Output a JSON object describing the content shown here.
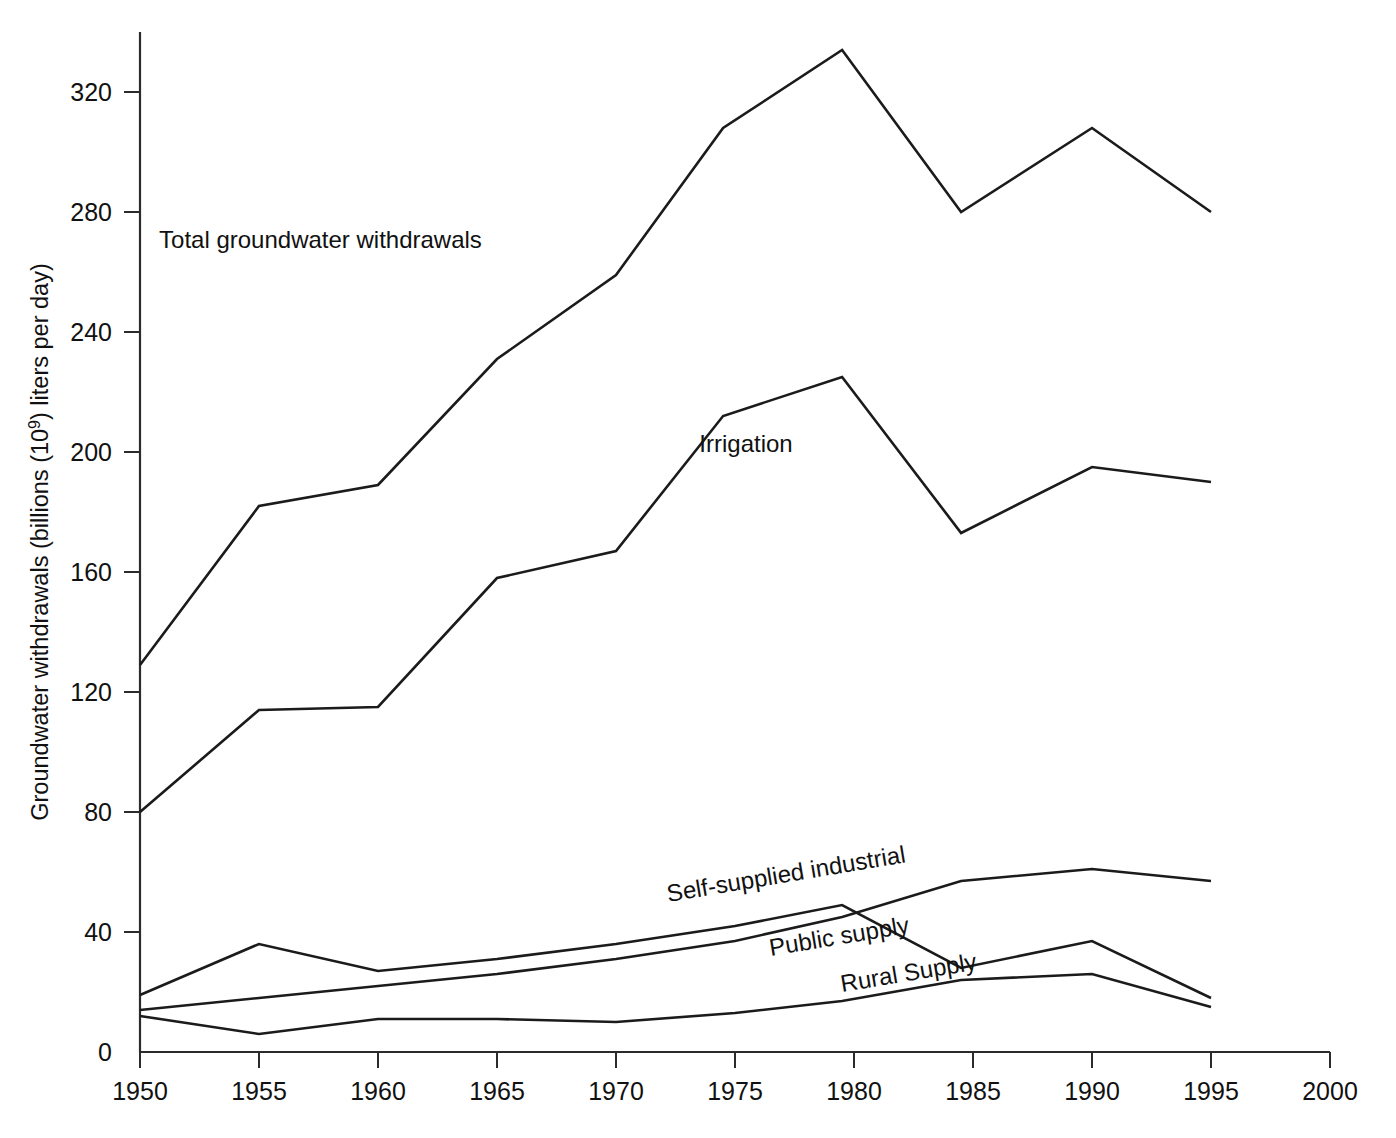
{
  "chart_data": {
    "type": "line",
    "title": "",
    "xlabel": "",
    "ylabel_full": "Groundwater withdrawals (billions (10⁹) liters per day)",
    "ylabel_prefix": "Groundwater withdrawals (billions (10",
    "ylabel_exponent": "9",
    "ylabel_suffix": ") liters per day)",
    "grid": false,
    "legend_position": "inline-labels",
    "xlim": [
      1950,
      2000
    ],
    "ylim": [
      0,
      340
    ],
    "xticks": [
      1950,
      1955,
      1960,
      1965,
      1970,
      1975,
      1980,
      1985,
      1990,
      1995,
      2000
    ],
    "xticklabels": [
      "1950",
      "1955",
      "1960",
      "1965",
      "1970",
      "1975",
      "1980",
      "1985",
      "1990",
      "1995",
      "2000"
    ],
    "yticks": [
      0,
      40,
      80,
      120,
      160,
      200,
      240,
      280,
      320
    ],
    "yticklabels": [
      "0",
      "40",
      "80",
      "120",
      "160",
      "200",
      "240",
      "280",
      "320"
    ],
    "series": [
      {
        "name": "Total groundwater withdrawals",
        "label": "Total groundwater withdrawals",
        "label_rotation": 0,
        "label_x": 1950.8,
        "label_y": 268,
        "color": "#1b1b1b",
        "x": [
          1950,
          1955,
          1960,
          1965,
          1970,
          1974.5,
          1979.5,
          1984.5,
          1990,
          1995
        ],
        "values": [
          129,
          182,
          189,
          231,
          259,
          308,
          334,
          280,
          308,
          280
        ]
      },
      {
        "name": "Irrigation",
        "label": "Irrigation",
        "label_rotation": 0,
        "label_x": 1973.5,
        "label_y": 200,
        "color": "#1b1b1b",
        "x": [
          1950,
          1955,
          1960,
          1965,
          1970,
          1974.5,
          1979.5,
          1984.5,
          1990,
          1995
        ],
        "values": [
          80,
          114,
          115,
          158,
          167,
          212,
          225,
          173,
          195,
          190
        ]
      },
      {
        "name": "Self-supplied industrial",
        "label": "Self-supplied industrial",
        "label_rotation": -9.5,
        "label_x": 1972.2,
        "label_y": 50,
        "color": "#1b1b1b",
        "x": [
          1950,
          1955,
          1960,
          1965,
          1970,
          1975,
          1979.5,
          1984.5,
          1990,
          1995
        ],
        "values": [
          19,
          36,
          27,
          31,
          36,
          42,
          49,
          28,
          37,
          18
        ]
      },
      {
        "name": "Public supply",
        "label": "Public supply",
        "label_rotation": -9.5,
        "label_x": 1976.5,
        "label_y": 32,
        "color": "#1b1b1b",
        "x": [
          1950,
          1955,
          1960,
          1965,
          1970,
          1975,
          1979.5,
          1984.5,
          1990,
          1995
        ],
        "values": [
          14,
          18,
          22,
          26,
          31,
          37,
          45,
          57,
          61,
          57
        ]
      },
      {
        "name": "Rural Supply",
        "label": "Rural Supply",
        "label_rotation": -9.5,
        "label_x": 1979.5,
        "label_y": 20,
        "color": "#1b1b1b",
        "x": [
          1950,
          1955,
          1960,
          1965,
          1970,
          1975,
          1979.5,
          1984.5,
          1990,
          1995
        ],
        "values": [
          12,
          6,
          11,
          11,
          10,
          13,
          17,
          24,
          26,
          15
        ]
      }
    ]
  }
}
